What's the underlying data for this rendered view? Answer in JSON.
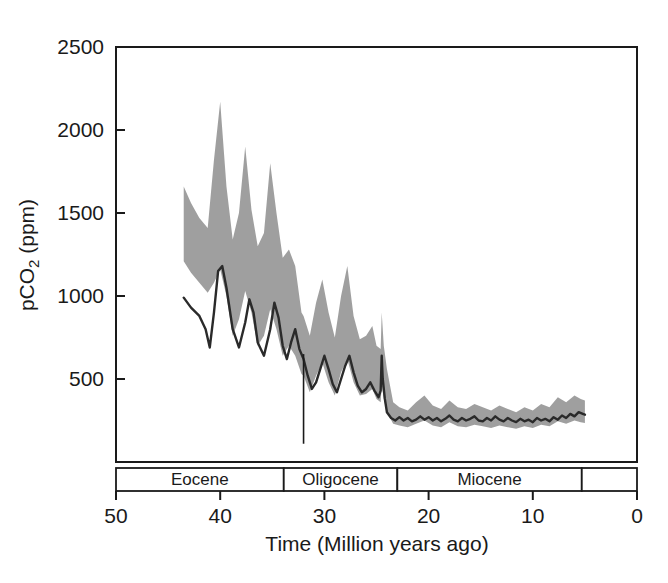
{
  "chart_data": {
    "type": "area",
    "title": "",
    "subtitle": "",
    "xlabel": "Time (Million years ago)",
    "ylabel": "pCO2 (ppm)",
    "ylabel_parts": {
      "pre": "pCO",
      "sub": "2",
      "post": " (ppm)"
    },
    "xlim": [
      50,
      0
    ],
    "ylim": [
      0,
      2500
    ],
    "x_reversed": true,
    "grid": false,
    "legend": "none",
    "xticks": [
      50,
      40,
      30,
      20,
      10,
      0
    ],
    "xtick_labels": [
      "50",
      "40",
      "30",
      "20",
      "10",
      "0"
    ],
    "yticks": [
      500,
      1000,
      1500,
      2000,
      2500
    ],
    "ytick_labels": [
      "500",
      "1000",
      "1500",
      "2000",
      "2500"
    ],
    "colors": {
      "band": "#9a9a9a",
      "line": "#2a2a2a",
      "axis": "#1a1a1a",
      "background": "#ffffff"
    },
    "annotations": [
      {
        "name": "eocene-oligocene-marker",
        "x": 32.0,
        "y_from": 650,
        "y_to": 110,
        "label": ""
      }
    ],
    "epoch_bands": [
      {
        "label": "Eocene",
        "start": 50.0,
        "end": 33.9
      },
      {
        "label": "Oligocene",
        "start": 33.9,
        "end": 23.0
      },
      {
        "label": "Miocene",
        "start": 23.0,
        "end": 5.3
      },
      {
        "label": "",
        "start": 5.3,
        "end": 0.0
      }
    ],
    "series": [
      {
        "name": "pCO2 uncertainty band (upper)",
        "role": "band_upper",
        "x": [
          43.5,
          42.8,
          42.0,
          41.2,
          40.6,
          40.0,
          39.4,
          38.8,
          38.2,
          37.6,
          37.0,
          36.4,
          35.8,
          35.2,
          34.6,
          34.0,
          33.4,
          32.8,
          32.2,
          32.0,
          31.4,
          30.8,
          30.2,
          29.6,
          29.0,
          28.4,
          27.8,
          27.2,
          26.6,
          26.0,
          25.4,
          25.0,
          24.6,
          24.5,
          24.3,
          24.0,
          23.4,
          22.8,
          22.0,
          21.2,
          20.4,
          19.6,
          18.8,
          18.0,
          17.2,
          16.4,
          15.6,
          14.8,
          14.0,
          13.2,
          12.4,
          11.6,
          10.8,
          10.0,
          9.2,
          8.4,
          7.6,
          6.8,
          6.0,
          5.4,
          5.0
        ],
        "values": [
          1660,
          1560,
          1470,
          1410,
          1820,
          2170,
          1660,
          1340,
          1500,
          1900,
          1520,
          1300,
          1380,
          1800,
          1500,
          1230,
          1280,
          1180,
          900,
          880,
          760,
          960,
          1100,
          900,
          750,
          1000,
          1180,
          880,
          740,
          760,
          820,
          700,
          680,
          900,
          700,
          560,
          360,
          330,
          310,
          360,
          400,
          340,
          320,
          370,
          330,
          320,
          350,
          330,
          310,
          340,
          320,
          300,
          330,
          310,
          350,
          330,
          390,
          360,
          400,
          380,
          370
        ]
      },
      {
        "name": "pCO2 uncertainty band (lower)",
        "role": "band_lower",
        "x": [
          43.5,
          42.8,
          42.0,
          41.2,
          40.6,
          40.0,
          39.4,
          38.8,
          38.2,
          37.6,
          37.0,
          36.4,
          35.8,
          35.2,
          34.6,
          34.0,
          33.4,
          32.8,
          32.2,
          32.0,
          31.4,
          30.8,
          30.2,
          29.6,
          29.0,
          28.4,
          27.8,
          27.2,
          26.6,
          26.0,
          25.4,
          25.0,
          24.6,
          24.5,
          24.3,
          24.0,
          23.4,
          22.8,
          22.0,
          21.2,
          20.4,
          19.6,
          18.8,
          18.0,
          17.2,
          16.4,
          15.6,
          14.8,
          14.0,
          13.2,
          12.4,
          11.6,
          10.8,
          10.0,
          9.2,
          8.4,
          7.6,
          6.8,
          6.0,
          5.4,
          5.0
        ],
        "values": [
          1210,
          1140,
          1080,
          1020,
          1080,
          1160,
          1000,
          760,
          860,
          1030,
          900,
          700,
          760,
          920,
          800,
          640,
          700,
          640,
          530,
          520,
          420,
          520,
          600,
          480,
          400,
          540,
          620,
          480,
          400,
          410,
          440,
          380,
          360,
          470,
          380,
          300,
          230,
          220,
          210,
          230,
          250,
          220,
          210,
          240,
          215,
          210,
          225,
          215,
          205,
          220,
          210,
          200,
          215,
          205,
          225,
          215,
          245,
          230,
          250,
          240,
          235
        ]
      },
      {
        "name": "pCO2 best estimate",
        "role": "center_line",
        "x": [
          43.5,
          42.8,
          42.0,
          41.4,
          41.0,
          40.6,
          40.2,
          39.8,
          39.4,
          38.8,
          38.2,
          37.6,
          37.2,
          36.8,
          36.4,
          35.8,
          35.2,
          34.8,
          34.4,
          34.0,
          33.6,
          33.2,
          32.8,
          32.4,
          32.0,
          31.6,
          31.2,
          30.8,
          30.4,
          30.0,
          29.6,
          29.2,
          28.8,
          28.4,
          28.0,
          27.6,
          27.2,
          26.8,
          26.4,
          26.0,
          25.6,
          25.2,
          24.8,
          24.6,
          24.5,
          24.4,
          24.2,
          24.0,
          23.6,
          23.2,
          22.8,
          22.4,
          22.0,
          21.6,
          21.2,
          20.8,
          20.4,
          20.0,
          19.6,
          19.2,
          18.8,
          18.4,
          18.0,
          17.6,
          17.2,
          16.8,
          16.4,
          16.0,
          15.6,
          15.2,
          14.8,
          14.4,
          14.0,
          13.6,
          13.2,
          12.8,
          12.4,
          12.0,
          11.6,
          11.2,
          10.8,
          10.4,
          10.0,
          9.6,
          9.2,
          8.8,
          8.4,
          8.0,
          7.6,
          7.2,
          6.8,
          6.4,
          6.0,
          5.6,
          5.2,
          5.0
        ],
        "values": [
          990,
          930,
          880,
          800,
          690,
          900,
          1150,
          1180,
          1050,
          800,
          690,
          840,
          980,
          900,
          720,
          640,
          800,
          960,
          870,
          700,
          620,
          720,
          800,
          680,
          620,
          520,
          440,
          480,
          560,
          640,
          560,
          470,
          420,
          500,
          580,
          640,
          540,
          460,
          420,
          440,
          480,
          430,
          390,
          430,
          640,
          500,
          380,
          300,
          265,
          250,
          270,
          250,
          265,
          245,
          255,
          275,
          255,
          270,
          250,
          265,
          245,
          260,
          280,
          255,
          245,
          265,
          250,
          260,
          275,
          250,
          245,
          265,
          250,
          275,
          255,
          245,
          265,
          250,
          240,
          260,
          245,
          255,
          240,
          265,
          250,
          260,
          245,
          270,
          255,
          280,
          265,
          290,
          275,
          300,
          290,
          285
        ]
      }
    ]
  },
  "axes": {
    "x_title": "Time (Million years ago)",
    "y_title_pre": "pCO",
    "y_title_sub": "2",
    "y_title_post": " (ppm)"
  }
}
